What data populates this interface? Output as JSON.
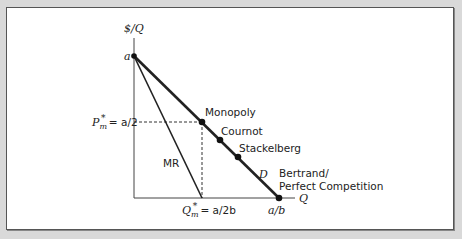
{
  "diagram": {
    "y_axis_label": "$/Q",
    "x_axis_label": "Q",
    "intercept_y_label": "a",
    "intercept_x_label": "a/b",
    "price_label_prefix": "P",
    "price_label_sub": "m",
    "price_label_sup": "*",
    "price_label_value": " = a/2",
    "quantity_label_prefix": "Q",
    "quantity_label_sub": "m",
    "quantity_label_sup": "*",
    "quantity_label_value": " = a/2b",
    "mr_label": "MR",
    "demand_label": "D",
    "points": {
      "monopoly": "Monopoly",
      "cournot": "Cournot",
      "stackelberg": "Stackelberg",
      "bertrand_line1": "Bertrand/",
      "bertrand_line2": "Perfect Competition"
    },
    "colors": {
      "background": "#d9d9d9",
      "panel": "#ffffff",
      "line": "#222222"
    }
  }
}
